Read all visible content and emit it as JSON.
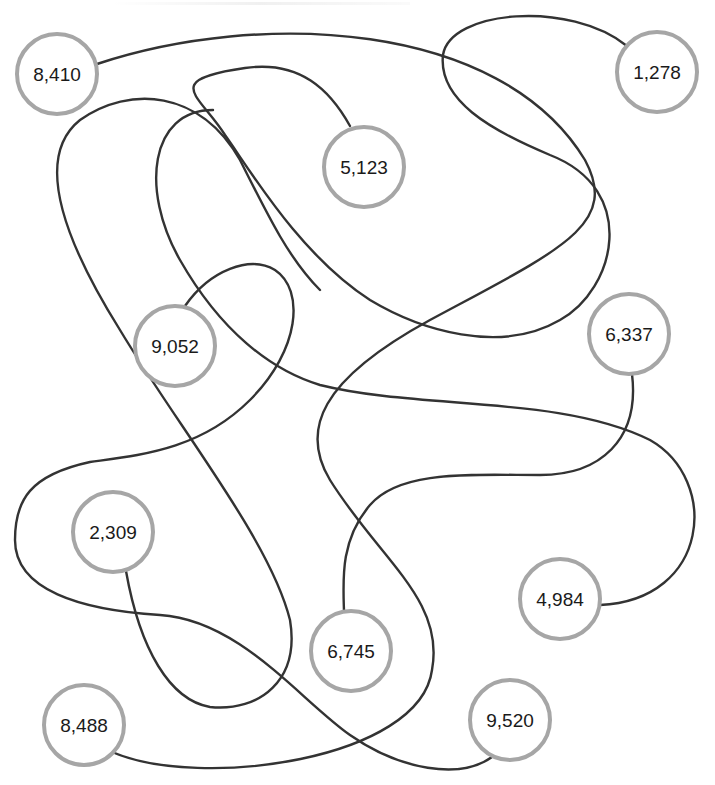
{
  "diagram": {
    "type": "tangled-lines-puzzle",
    "colors": {
      "background": "#ffffff",
      "line": "#333333",
      "node_border": "#a6a6a6",
      "node_fill": "#ffffff",
      "label": "#1a1a1a"
    },
    "nodes": [
      {
        "id": "n8410",
        "label": "8,410",
        "cx": 57,
        "cy": 74,
        "r": 40
      },
      {
        "id": "n1278",
        "label": "1,278",
        "cx": 657,
        "cy": 72,
        "r": 40
      },
      {
        "id": "n5123",
        "label": "5,123",
        "cx": 364,
        "cy": 167,
        "r": 40
      },
      {
        "id": "n9052",
        "label": "9,052",
        "cx": 175,
        "cy": 346,
        "r": 40
      },
      {
        "id": "n6337",
        "label": "6,337",
        "cx": 629,
        "cy": 334,
        "r": 40
      },
      {
        "id": "n2309",
        "label": "2,309",
        "cx": 113,
        "cy": 532,
        "r": 40
      },
      {
        "id": "n4984",
        "label": "4,984",
        "cx": 560,
        "cy": 599,
        "r": 40
      },
      {
        "id": "n6745",
        "label": "6,745",
        "cx": 351,
        "cy": 651,
        "r": 40
      },
      {
        "id": "n8488",
        "label": "8,488",
        "cx": 84,
        "cy": 725,
        "r": 40
      },
      {
        "id": "n9520",
        "label": "9,520",
        "cx": 510,
        "cy": 720,
        "r": 40
      }
    ],
    "connections": [
      {
        "from": "8,410",
        "to": "8,488",
        "d": "M 97 64 C 260 10, 500 20, 585 160 C 620 225, 560 250, 430 320 C 320 380, 300 430, 330 480 C 380 560, 445 600, 432 670 C 420 760, 200 790, 112 752"
      },
      {
        "from": "1,278",
        "to": "5,123",
        "d": "M 627 46 C 570 0, 450 10, 443 55 C 438 100, 490 130, 550 155 C 640 190, 615 290, 560 320 C 500 355, 420 330, 370 300 C 300 255, 250 170, 225 135 C 200 95, 160 80, 245 68 C 300 60, 330 90, 350 126"
      },
      {
        "from": "5,123",
        "to": "4,984",
        "d": "M 213 110 C 150 110, 140 190, 180 260 C 220 330, 270 370, 320 385 C 420 410, 560 395, 650 440 C 720 480, 710 600, 600 605"
      },
      {
        "from": "9,052",
        "to": "9,520",
        "d": "M 185 306 C 210 270, 250 255, 275 270 C 305 290, 300 350, 250 400 C 200 450, 140 455, 90 462 C 30 475, 15 500, 15 540 C 15 590, 80 610, 160 615 C 240 620, 300 700, 350 735 C 400 770, 460 780, 492 757"
      },
      {
        "from": "6,337",
        "to": "6,745",
        "d": "M 632 374 C 640 440, 600 475, 540 475 C 470 475, 400 470, 370 505 C 340 540, 343 580, 344 611"
      },
      {
        "from": "2,309",
        "to": "unseen",
        "d": "M 126 571 C 140 650, 170 700, 210 707 C 260 712, 300 680, 290 620 C 270 540, 180 430, 120 330 C 70 250, 30 160, 80 120 C 130 85, 200 90, 240 160 C 270 220, 290 260, 320 290"
      }
    ]
  }
}
